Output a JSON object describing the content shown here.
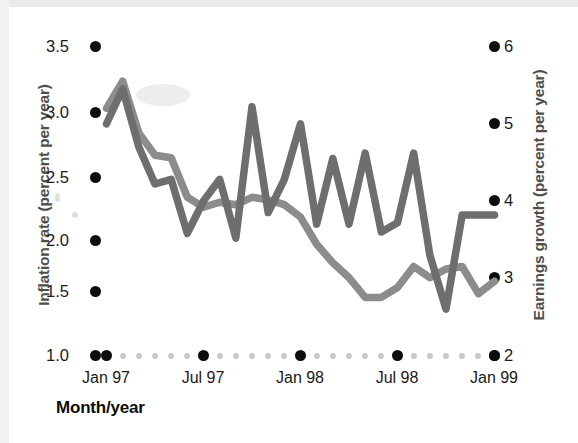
{
  "figure": {
    "background_color": "#ffffff",
    "x_axis_title": "Month/year",
    "left_axis_title": "Inflation rate (percent per year)",
    "right_axis_title": "Earnings growth (percent per year)"
  },
  "axes": {
    "left_ticks": [
      "3.5",
      "3.0",
      "2.5",
      "2.0",
      "1.5",
      "1.0"
    ],
    "right_ticks": [
      "6",
      "5",
      "4",
      "3",
      "2"
    ],
    "x_ticks": [
      "Jan 97",
      "Jul 97",
      "Jan 98",
      "Jul 98",
      "Jan 99"
    ]
  },
  "chart_data": {
    "type": "line",
    "title": "",
    "xlabel": "Month/year",
    "ylabel": "Inflation rate (percent per year)",
    "y2label": "Earnings growth (percent per year)",
    "grid": false,
    "legend": "none",
    "x_tick_labels": [
      "Jan 97",
      "Jul 97",
      "Jan 98",
      "Jul 98",
      "Jan 99"
    ],
    "x_tick_index": [
      0,
      6,
      12,
      18,
      24
    ],
    "x_minor_tick_step_months": 1,
    "ylim": [
      1.0,
      3.5
    ],
    "y2lim": [
      2,
      6.5
    ],
    "x": [
      "Jan 97",
      "Feb 97",
      "Mar 97",
      "Apr 97",
      "May 97",
      "Jun 97",
      "Jul 97",
      "Aug 97",
      "Sep 97",
      "Oct 97",
      "Nov 97",
      "Dec 97",
      "Jan 98",
      "Feb 98",
      "Mar 98",
      "Apr 98",
      "May 98",
      "Jun 98",
      "Jul 98",
      "Aug 98",
      "Sep 98",
      "Oct 98",
      "Nov 98",
      "Dec 98",
      "Jan 99"
    ],
    "series": [
      {
        "name": "Inflation rate",
        "axis": "left",
        "color": "#8c8c8c",
        "units": "percent per year",
        "values": [
          3.0,
          3.22,
          2.8,
          2.62,
          2.6,
          2.28,
          2.2,
          2.24,
          2.22,
          2.28,
          2.26,
          2.22,
          2.12,
          1.9,
          1.75,
          1.63,
          1.47,
          1.47,
          1.55,
          1.72,
          1.63,
          1.7,
          1.72,
          1.5,
          1.6
        ]
      },
      {
        "name": "Earnings growth",
        "axis": "right",
        "color": "#6e6e6e",
        "units": "percent per year",
        "values": [
          5.0,
          5.45,
          4.7,
          4.22,
          4.28,
          3.58,
          4.0,
          4.28,
          3.52,
          5.22,
          3.85,
          4.28,
          5.0,
          3.7,
          4.55,
          3.7,
          4.62,
          3.6,
          3.72,
          4.62,
          3.3,
          2.6,
          3.82,
          3.82,
          3.82
        ]
      }
    ]
  }
}
